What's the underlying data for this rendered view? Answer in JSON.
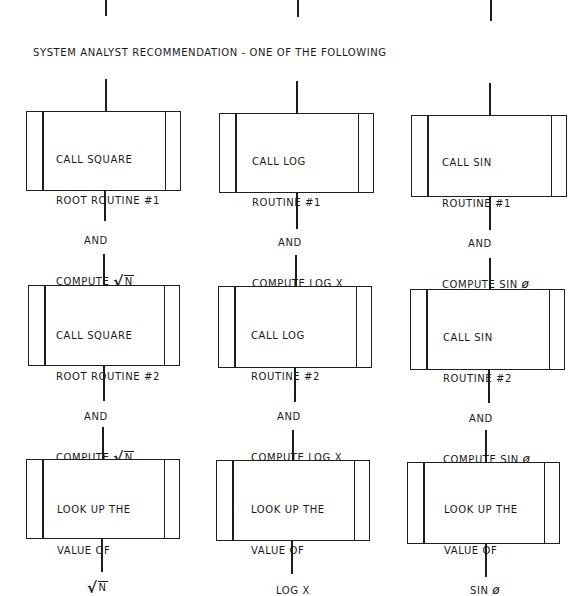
{
  "heading": "SYSTEM ANALYST RECOMMENDATION - ONE OF THE FOLLOWING",
  "columns": [
    {
      "name": "square-root",
      "boxes": [
        {
          "lines": [
            "CALL SQUARE",
            "ROOT ROUTINE #1",
            "AND",
            "COMPUTE"
          ],
          "symbol": "N",
          "symbol_type": "sqrt"
        },
        {
          "lines": [
            "CALL SQUARE",
            "ROOT ROUTINE #2",
            "AND",
            "COMPUTE"
          ],
          "symbol": "N",
          "symbol_type": "sqrt"
        },
        {
          "lines": [
            "LOOK UP THE",
            "VALUE OF"
          ],
          "symbol": "N",
          "symbol_type": "sqrt"
        }
      ]
    },
    {
      "name": "log",
      "boxes": [
        {
          "lines": [
            "CALL LOG",
            "ROUTINE #1",
            "AND",
            "COMPUTE LOG X"
          ]
        },
        {
          "lines": [
            "CALL LOG",
            "ROUTINE #2",
            "AND",
            "COMPUTE LOG X"
          ]
        },
        {
          "lines": [
            "LOOK UP THE",
            "VALUE OF",
            "LOG X"
          ]
        }
      ]
    },
    {
      "name": "sine",
      "boxes": [
        {
          "lines": [
            "CALL SIN",
            "ROUTINE #1",
            "AND",
            "COMPUTE SIN"
          ],
          "symbol": "ø",
          "symbol_type": "phi"
        },
        {
          "lines": [
            "CALL SIN",
            "ROUTINE #2",
            "AND",
            "COMPUTE SIN"
          ],
          "symbol": "ø",
          "symbol_type": "phi"
        },
        {
          "lines": [
            "LOOK UP THE",
            "VALUE OF",
            "SIN"
          ],
          "symbol": "ø",
          "symbol_type": "phi"
        }
      ]
    }
  ],
  "symbols": {
    "sqrt_radical": "√",
    "phi": "ø"
  },
  "colors": {
    "line": "#1e1e1e",
    "background": "#ffffff",
    "text": "#1a1a1a"
  }
}
